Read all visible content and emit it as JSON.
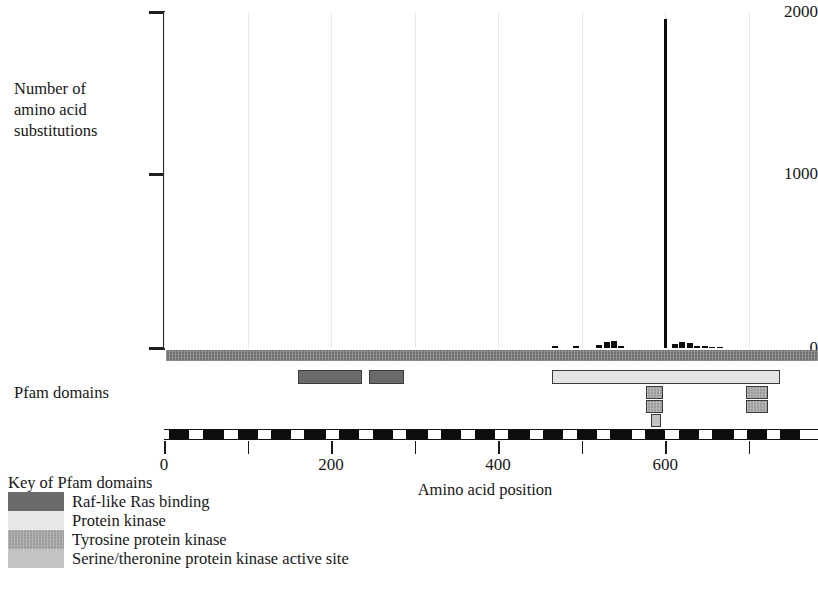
{
  "chart_data": {
    "type": "bar",
    "title": "",
    "xlabel": "Amino acid position",
    "ylabel": "Number of\namino acid\nsubstitutions",
    "ylim": [
      0,
      2000
    ],
    "xlim": [
      0,
      783
    ],
    "ytick_labels": [
      "2000",
      "1000",
      "0"
    ],
    "ytick_values": [
      2000,
      1000,
      0
    ],
    "xtick_values": [
      0,
      100,
      200,
      300,
      400,
      500,
      600,
      700
    ],
    "xtick_labels": [
      "0",
      "",
      "200",
      "",
      "400",
      "",
      "600",
      ""
    ],
    "grid": "vertical-light",
    "legend_position": "below-left",
    "series": [
      {
        "name": "amino acid substitutions",
        "x": [
          466,
          491,
          519,
          528,
          536,
          545,
          600,
          609,
          618,
          627,
          636,
          645,
          654,
          663
        ],
        "values": [
          12,
          10,
          16,
          34,
          40,
          14,
          1960,
          22,
          36,
          30,
          12,
          10,
          8,
          6
        ]
      }
    ],
    "annotations": [
      {
        "label": "peak",
        "x": 600,
        "y": 1960
      }
    ]
  },
  "axis": {
    "ylabel_lines": [
      "Number of",
      "amino acid",
      "substitutions"
    ],
    "xlabel": "Amino acid position"
  },
  "tracks": {
    "pfam_label": "Pfam domains",
    "backbone": {
      "name": "protein-backbone",
      "start": 0,
      "end": 783,
      "color": "#6e6e6e"
    },
    "domains": [
      {
        "name": "Raf-like Ras binding",
        "start": 160,
        "end": 237,
        "row": 0,
        "color": "#6b6b6b"
      },
      {
        "name": "Raf-like Ras binding",
        "start": 245,
        "end": 287,
        "row": 0,
        "color": "#6b6b6b"
      },
      {
        "name": "Protein kinase",
        "start": 465,
        "end": 738,
        "row": 0,
        "color": "#e3e3e3"
      },
      {
        "name": "Tyrosine protein kinase",
        "start": 577,
        "end": 598,
        "row": 1,
        "color": "#9c9c9c"
      },
      {
        "name": "Tyrosine protein kinase",
        "start": 577,
        "end": 598,
        "row": 2,
        "color": "#9c9c9c"
      },
      {
        "name": "Serine/threonine protein kinase active site",
        "start": 583,
        "end": 595,
        "row": 3,
        "color": "#c3c3c3"
      },
      {
        "name": "Tyrosine protein kinase",
        "start": 697,
        "end": 723,
        "row": 1,
        "color": "#9c9c9c"
      },
      {
        "name": "Tyrosine protein kinase",
        "start": 697,
        "end": 723,
        "row": 2,
        "color": "#9c9c9c"
      }
    ],
    "exon_blocks": [
      {
        "start": 6,
        "end": 30
      },
      {
        "start": 47,
        "end": 72
      },
      {
        "start": 88,
        "end": 112
      },
      {
        "start": 128,
        "end": 152
      },
      {
        "start": 168,
        "end": 194
      },
      {
        "start": 210,
        "end": 234
      },
      {
        "start": 250,
        "end": 274
      },
      {
        "start": 290,
        "end": 316
      },
      {
        "start": 332,
        "end": 356
      },
      {
        "start": 372,
        "end": 396
      },
      {
        "start": 412,
        "end": 438
      },
      {
        "start": 454,
        "end": 478
      },
      {
        "start": 494,
        "end": 518
      },
      {
        "start": 534,
        "end": 560
      },
      {
        "start": 576,
        "end": 600
      },
      {
        "start": 616,
        "end": 640
      },
      {
        "start": 656,
        "end": 682
      },
      {
        "start": 698,
        "end": 722
      },
      {
        "start": 738,
        "end": 762
      }
    ]
  },
  "legend": {
    "title": "Key of Pfam domains",
    "items": [
      {
        "label": "Raf-like Ras binding",
        "color": "#6b6b6b",
        "textured": false
      },
      {
        "label": "Protein kinase",
        "color": "#e8e8e8",
        "textured": false
      },
      {
        "label": "Tyrosine protein kinase",
        "color": "#9c9c9c",
        "textured": true
      },
      {
        "label": "Serine/theronine protein kinase active site",
        "color": "#c3c3c3",
        "textured": false
      }
    ]
  },
  "colors": {
    "axis": "#1f1f1f",
    "spike": "#0d0d0d",
    "grid": "#e9e9e9",
    "backbone": "#6e6e6e"
  }
}
